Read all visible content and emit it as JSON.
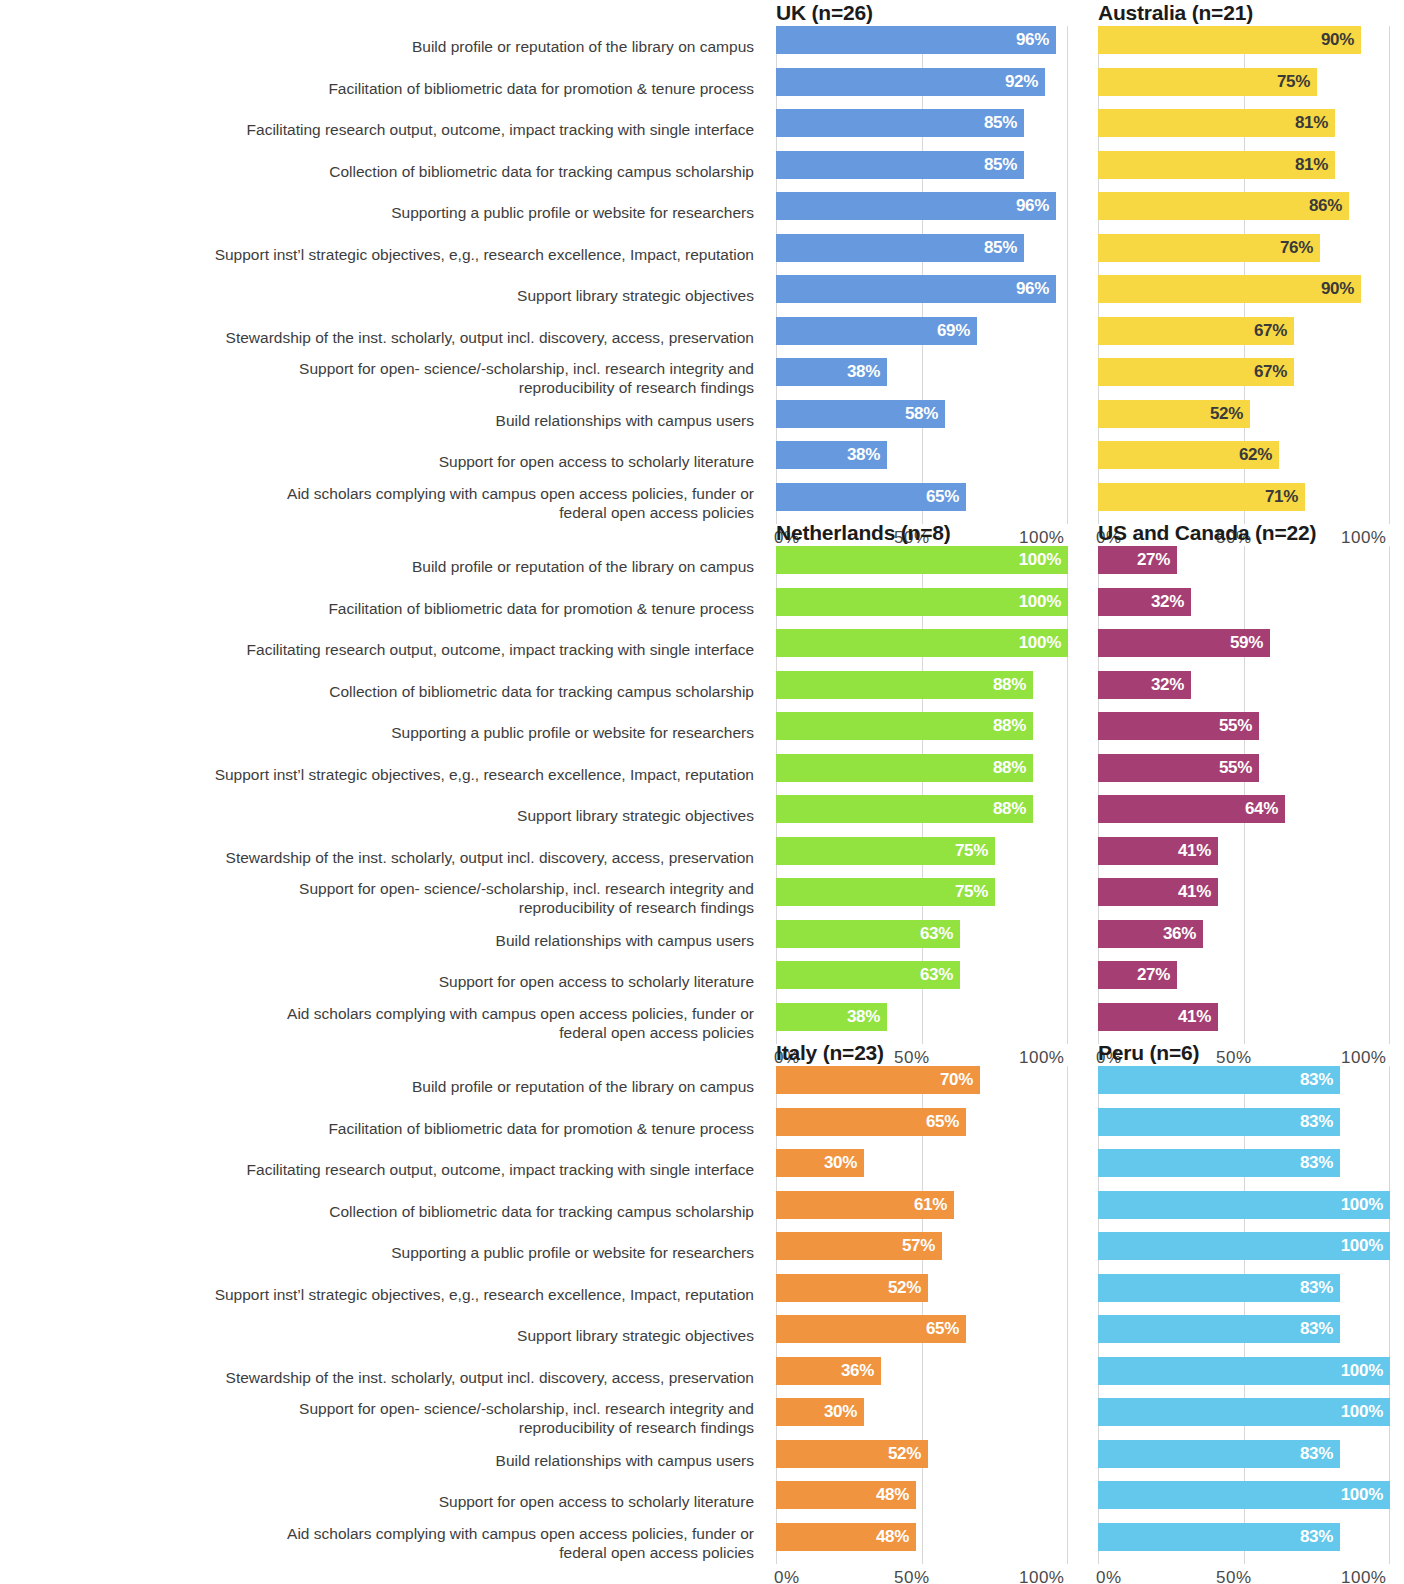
{
  "categories": [
    "Build profile or reputation of the library on campus",
    "Facilitation of bibliometric data for promotion & tenure process",
    "Facilitating research output, outcome, impact tracking with single interface",
    "Collection of bibliometric data for tracking campus scholarship",
    "Supporting a public profile or website for researchers",
    "Support inst’l strategic objectives, e,g., research excellence, Impact, reputation",
    "Support library strategic objectives",
    "Stewardship of the inst. scholarly, output incl. discovery, access, preservation",
    "Support for open- science/-scholarship, incl. research integrity and\nreproducibility of research findings",
    "Build relationships with campus users",
    "Support for open access to scholarly literature",
    "Aid scholars complying with campus open access policies, funder or\nfederal open access policies"
  ],
  "axis": {
    "ticks": [
      "0%",
      "50%",
      "100%"
    ],
    "min": 0,
    "max": 100
  },
  "chart_data": {
    "type": "bar",
    "title": "",
    "xlabel": "",
    "ylabel": "",
    "xlim": [
      0,
      100
    ],
    "grid": true,
    "legend": "none",
    "orientation": "horizontal",
    "value_suffix": "%",
    "categories": [
      "Build profile or reputation of the library on campus",
      "Facilitation of bibliometric data for promotion & tenure process",
      "Facilitating research output, outcome, impact tracking with single interface",
      "Collection of bibliometric data for tracking campus scholarship",
      "Supporting a public profile or website for researchers",
      "Support inst’l strategic objectives, e,g., research excellence, Impact, reputation",
      "Support library strategic objectives",
      "Stewardship of the inst. scholarly, output incl. discovery, access, preservation",
      "Support for open- science/-scholarship, incl. research integrity and reproducibility of research findings",
      "Build relationships with campus users",
      "Support for open access to scholarly literature",
      "Aid scholars complying with campus open access policies, funder or federal open access policies"
    ],
    "series": [
      {
        "name": "UK (n=26)",
        "region": "UK",
        "n": 26,
        "color": "#6699DD",
        "label_color": "light",
        "values": [
          96,
          92,
          85,
          85,
          96,
          85,
          96,
          69,
          38,
          58,
          38,
          65
        ],
        "value_labels": [
          "96%",
          "92%",
          "85%",
          "85%",
          "96%",
          "85%",
          "96%",
          "69%",
          "38%",
          "58%",
          "38%",
          "65%"
        ]
      },
      {
        "name": "Australia (n=21)",
        "region": "Australia",
        "n": 21,
        "color": "#F7D842",
        "label_color": "dark",
        "values": [
          90,
          75,
          81,
          81,
          86,
          76,
          90,
          67,
          67,
          52,
          62,
          71
        ],
        "value_labels": [
          "90%",
          "75%",
          "81%",
          "81%",
          "86%",
          "76%",
          "90%",
          "67%",
          "67%",
          "52%",
          "62%",
          "71%"
        ]
      },
      {
        "name": "Netherlands (n=8)",
        "region": "Netherlands",
        "n": 8,
        "color": "#92E33F",
        "label_color": "light",
        "values": [
          100,
          100,
          100,
          88,
          88,
          88,
          88,
          75,
          75,
          63,
          63,
          38
        ],
        "value_labels": [
          "100%",
          "100%",
          "100%",
          "88%",
          "88%",
          "88%",
          "88%",
          "75%",
          "75%",
          "63%",
          "63%",
          "38%"
        ]
      },
      {
        "name": "US and Canada (n=22)",
        "region": "US and Canada",
        "n": 22,
        "color": "#A53F73",
        "label_color": "light",
        "values": [
          27,
          32,
          59,
          32,
          55,
          55,
          64,
          41,
          41,
          36,
          27,
          41
        ],
        "value_labels": [
          "27%",
          "32%",
          "59%",
          "32%",
          "55%",
          "55%",
          "64%",
          "41%",
          "41%",
          "36%",
          "27%",
          "41%"
        ]
      },
      {
        "name": "Italy (n=23)",
        "region": "Italy",
        "n": 23,
        "color": "#F0943F",
        "label_color": "light",
        "values": [
          70,
          65,
          30,
          61,
          57,
          52,
          65,
          36,
          30,
          52,
          48,
          48
        ],
        "value_labels": [
          "70%",
          "65%",
          "30%",
          "61%",
          "57%",
          "52%",
          "65%",
          "36%",
          "30%",
          "52%",
          "48%",
          "48%"
        ]
      },
      {
        "name": "Peru (n=6)",
        "region": "Peru",
        "n": 6,
        "color": "#64C8EC",
        "label_color": "light",
        "values": [
          83,
          83,
          83,
          100,
          100,
          83,
          83,
          100,
          100,
          83,
          100,
          83
        ],
        "value_labels": [
          "83%",
          "83%",
          "83%",
          "100%",
          "100%",
          "83%",
          "83%",
          "100%",
          "100%",
          "83%",
          "100%",
          "83%"
        ]
      }
    ],
    "blocks": [
      {
        "series_index": [
          0,
          1
        ]
      },
      {
        "series_index": [
          2,
          3
        ]
      },
      {
        "series_index": [
          4,
          5
        ]
      }
    ]
  }
}
